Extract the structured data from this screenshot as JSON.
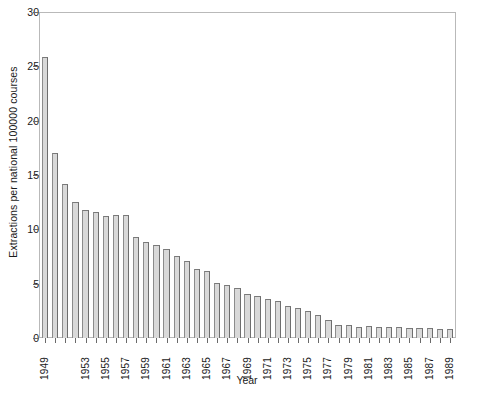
{
  "chart_data": {
    "type": "bar",
    "title": "",
    "subtitle": "",
    "xlabel": "Year",
    "ylabel": "Extractions per national 100000 courses",
    "ylim": [
      0,
      30
    ],
    "yticks": [
      0,
      5,
      10,
      15,
      20,
      25,
      30
    ],
    "grid": false,
    "legend": null,
    "xtick_labels": [
      "1949",
      "1953",
      "1955",
      "1957",
      "1959",
      "1961",
      "1963",
      "1965",
      "1967",
      "1969",
      "1971",
      "1973",
      "1975",
      "1977",
      "1979",
      "1981",
      "1983",
      "1985",
      "1987",
      "1989"
    ],
    "categories": [
      "1949",
      "1950",
      "1951",
      "1952",
      "1953",
      "1954",
      "1955",
      "1956",
      "1957",
      "1958",
      "1959",
      "1960",
      "1961",
      "1962",
      "1963",
      "1964",
      "1965",
      "1966",
      "1967",
      "1968",
      "1969",
      "1970",
      "1971",
      "1972",
      "1973",
      "1974",
      "1975",
      "1976",
      "1977",
      "1978",
      "1979",
      "1980",
      "1981",
      "1982",
      "1983",
      "1984",
      "1985",
      "1986",
      "1987",
      "1988",
      "1989"
    ],
    "values": [
      25.9,
      17.1,
      14.2,
      12.6,
      11.8,
      11.6,
      11.3,
      11.4,
      11.4,
      9.3,
      8.9,
      8.6,
      8.2,
      7.6,
      7.1,
      6.4,
      6.2,
      5.1,
      4.9,
      4.6,
      4.1,
      3.9,
      3.6,
      3.4,
      3.0,
      2.8,
      2.5,
      2.1,
      1.7,
      1.2,
      1.2,
      1.0,
      1.1,
      1.0,
      1.0,
      1.0,
      0.9,
      0.9,
      0.9,
      0.8,
      0.8
    ]
  }
}
